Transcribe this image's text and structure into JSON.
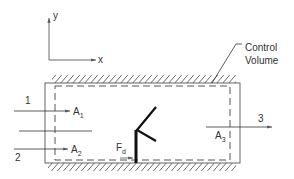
{
  "diagram": {
    "type": "control-volume",
    "axes": {
      "y_label": "y",
      "x_label": "x"
    },
    "callout": {
      "line1": "Control",
      "line2": "Volume"
    },
    "streams": [
      {
        "id": "1",
        "label": "1",
        "area": "A",
        "area_sub": "1"
      },
      {
        "id": "2",
        "label": "2",
        "area": "A",
        "area_sub": "2"
      },
      {
        "id": "3",
        "label": "3",
        "area": "A",
        "area_sub": "3"
      }
    ],
    "force": {
      "label": "F",
      "sub": "d"
    },
    "colors": {
      "line": "#333333",
      "background": "#ffffff"
    }
  }
}
